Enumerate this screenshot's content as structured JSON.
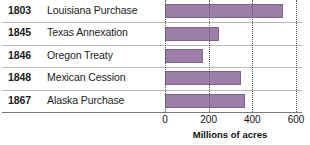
{
  "chart_data": {
    "type": "bar",
    "orientation": "horizontal",
    "title": "",
    "xlabel": "Millions of acres",
    "ylabel": "",
    "xlim": [
      0,
      600
    ],
    "xticks": [
      0,
      200,
      400,
      600
    ],
    "xtick_labels": [
      "0",
      "200",
      "400",
      "600"
    ],
    "grid": true,
    "grid_style": "dotted vertical",
    "legend": false,
    "bar_color": "#9c7fa9",
    "bar_border_color": "#7e6489",
    "categories": [
      "Louisiana Purchase",
      "Texas Annexation",
      "Oregon Treaty",
      "Mexican Cession",
      "Alaska Purchase"
    ],
    "years": [
      "1803",
      "1845",
      "1846",
      "1848",
      "1867"
    ],
    "values": [
      540,
      247,
      174,
      348,
      366
    ],
    "rows": [
      {
        "year": "1803",
        "event": "Louisiana Purchase",
        "value": 540
      },
      {
        "year": "1845",
        "event": "Texas Annexation",
        "value": 247
      },
      {
        "year": "1846",
        "event": "Oregon Treaty",
        "value": 174
      },
      {
        "year": "1848",
        "event": "Mexican Cession",
        "value": 348
      },
      {
        "year": "1867",
        "event": "Alaska Purchase",
        "value": 366
      }
    ]
  }
}
